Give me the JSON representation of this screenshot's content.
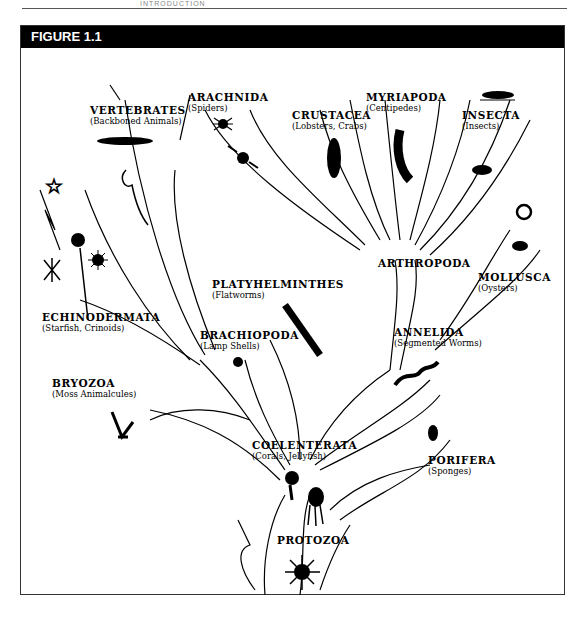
{
  "page": {
    "running_head": "INTRODUCTION"
  },
  "figure": {
    "title": "FIGURE 1.1",
    "groups": [
      {
        "name": "VERTEBRATES",
        "common": "(Backboned Animals)"
      },
      {
        "name": "ARACHNIDA",
        "common": "(Spiders)"
      },
      {
        "name": "CRUSTACEA",
        "common": "(Lobsters, Crabs)"
      },
      {
        "name": "MYRIAPODA",
        "common": "(Centipedes)"
      },
      {
        "name": "INSECTA",
        "common": "(Insects)"
      },
      {
        "name": "ARTHROPODA",
        "common": ""
      },
      {
        "name": "MOLLUSCA",
        "common": "(Oysters)"
      },
      {
        "name": "PLATYHELMINTHES",
        "common": "(Flatworms)"
      },
      {
        "name": "ECHINODERMATA",
        "common": "(Starfish, Crinoids)"
      },
      {
        "name": "BRACHIOPODA",
        "common": "(Lamp Shells)"
      },
      {
        "name": "ANNELIDA",
        "common": "(Segmented Worms)"
      },
      {
        "name": "BRYOZOA",
        "common": "(Moss Animalcules)"
      },
      {
        "name": "COELENTERATA",
        "common": "(Corals, Jellyfish)"
      },
      {
        "name": "PORIFERA",
        "common": "(Sponges)"
      },
      {
        "name": "PROTOZOA",
        "common": ""
      }
    ]
  }
}
